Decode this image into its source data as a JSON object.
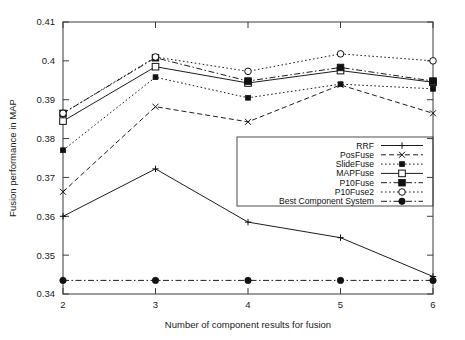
{
  "chart_data": {
    "type": "line",
    "title": "",
    "xlabel": "Number of component results for fusion",
    "ylabel": "Fusion performance in MAP",
    "x": [
      2,
      3,
      4,
      5,
      6
    ],
    "xticklabels": [
      "2",
      "3",
      "4",
      "5",
      "6"
    ],
    "yticklabels": [
      "0.34",
      "0.35",
      "0.36",
      "0.37",
      "0.38",
      "0.39",
      "0.4",
      "0.41"
    ],
    "yticks": [
      0.34,
      0.35,
      0.36,
      0.37,
      0.38,
      0.39,
      0.4,
      0.41
    ],
    "xlim": [
      2,
      6
    ],
    "ylim": [
      0.34,
      0.41
    ],
    "grid": false,
    "legend_position": "center-right",
    "series": [
      {
        "name": "RRF",
        "marker": "plus",
        "linestyle": "solid",
        "values": [
          0.36,
          0.3722,
          0.3585,
          0.3545,
          0.3445
        ]
      },
      {
        "name": "PosFuse",
        "marker": "cross",
        "linestyle": "dashed",
        "values": [
          0.3663,
          0.3882,
          0.3843,
          0.3938,
          0.3865
        ]
      },
      {
        "name": "SlideFuse",
        "marker": "filled-square-small",
        "linestyle": "dotted",
        "values": [
          0.377,
          0.3958,
          0.3905,
          0.394,
          0.3928
        ]
      },
      {
        "name": "MAPFuse",
        "marker": "open-square",
        "linestyle": "solid",
        "values": [
          0.3845,
          0.3985,
          0.3943,
          0.3975,
          0.3945
        ]
      },
      {
        "name": "P10Fuse",
        "marker": "filled-square",
        "linestyle": "dash-dot",
        "values": [
          0.3865,
          0.4008,
          0.3948,
          0.3983,
          0.3948
        ]
      },
      {
        "name": "P10Fuse2",
        "marker": "open-circle",
        "linestyle": "dotted",
        "values": [
          0.3865,
          0.401,
          0.3973,
          0.4018,
          0.4
        ]
      },
      {
        "name": "Best Component System",
        "marker": "filled-circle",
        "linestyle": "dash-dot",
        "values": [
          0.3435,
          0.3435,
          0.3435,
          0.3435,
          0.3435
        ]
      }
    ]
  },
  "legend": {
    "entries": [
      {
        "label": "RRF"
      },
      {
        "label": "PosFuse"
      },
      {
        "label": "SlideFuse"
      },
      {
        "label": "MAPFuse"
      },
      {
        "label": "P10Fuse"
      },
      {
        "label": "P10Fuse2"
      },
      {
        "label": "Best Component System"
      }
    ]
  },
  "colors": {
    "line": "#111111",
    "axis": "#3a3a3a",
    "background": "#ffffff"
  }
}
